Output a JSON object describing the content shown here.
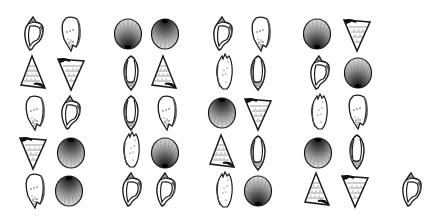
{
  "figure": {
    "title": "Shell matching array",
    "groups": 4,
    "rows": 5,
    "cols_per_group": 2
  },
  "colors": {
    "ink": "#1a1a1a",
    "shade": "#2b2b2b",
    "paper": "#ffffff"
  },
  "shell_types": {
    "conch": "whelk-shell-icon",
    "cone": "cone-shell-icon",
    "scallop_dark_top": "scallop-shell-dark-top-icon",
    "scallop_dark_bottom": "scallop-shell-dark-bottom-icon",
    "tri_up": "triangle-shell-up-icon",
    "tri_down": "triangle-shell-down-icon",
    "oliva": "olive-shell-icon",
    "torn": "broken-shell-icon"
  },
  "shells": [
    {
      "group": 1,
      "row": 1,
      "col": 1,
      "type": "conch",
      "x": 19,
      "y": 15
    },
    {
      "group": 1,
      "row": 1,
      "col": 2,
      "type": "cone",
      "x": 56,
      "y": 15
    },
    {
      "group": 1,
      "row": 2,
      "col": 1,
      "type": "tri_up",
      "x": 18,
      "y": 54
    },
    {
      "group": 1,
      "row": 2,
      "col": 2,
      "type": "tri_down",
      "x": 56,
      "y": 54
    },
    {
      "group": 1,
      "row": 3,
      "col": 1,
      "type": "cone",
      "x": 20,
      "y": 94
    },
    {
      "group": 1,
      "row": 3,
      "col": 2,
      "type": "conch",
      "x": 56,
      "y": 94
    },
    {
      "group": 1,
      "row": 4,
      "col": 1,
      "type": "tri_down",
      "x": 18,
      "y": 133
    },
    {
      "group": 1,
      "row": 4,
      "col": 2,
      "type": "scallop_dark_top",
      "x": 56,
      "y": 134
    },
    {
      "group": 1,
      "row": 5,
      "col": 1,
      "type": "cone",
      "x": 20,
      "y": 172
    },
    {
      "group": 1,
      "row": 5,
      "col": 2,
      "type": "scallop_dark_top",
      "x": 54,
      "y": 172
    },
    {
      "group": 2,
      "row": 1,
      "col": 1,
      "type": "scallop_dark_bottom",
      "x": 113,
      "y": 15
    },
    {
      "group": 2,
      "row": 1,
      "col": 2,
      "type": "scallop_dark_top",
      "x": 150,
      "y": 15
    },
    {
      "group": 2,
      "row": 2,
      "col": 1,
      "type": "oliva",
      "x": 116,
      "y": 54
    },
    {
      "group": 2,
      "row": 2,
      "col": 2,
      "type": "tri_up",
      "x": 149,
      "y": 54
    },
    {
      "group": 2,
      "row": 3,
      "col": 1,
      "type": "oliva",
      "x": 116,
      "y": 94
    },
    {
      "group": 2,
      "row": 3,
      "col": 2,
      "type": "cone",
      "x": 152,
      "y": 94
    },
    {
      "group": 2,
      "row": 4,
      "col": 1,
      "type": "torn",
      "x": 117,
      "y": 131
    },
    {
      "group": 2,
      "row": 4,
      "col": 2,
      "type": "scallop_dark_bottom",
      "x": 150,
      "y": 134
    },
    {
      "group": 2,
      "row": 5,
      "col": 1,
      "type": "conch",
      "x": 117,
      "y": 171
    },
    {
      "group": 2,
      "row": 5,
      "col": 2,
      "type": "conch",
      "x": 151,
      "y": 171
    },
    {
      "group": 3,
      "row": 1,
      "col": 1,
      "type": "conch",
      "x": 208,
      "y": 15
    },
    {
      "group": 3,
      "row": 1,
      "col": 2,
      "type": "cone",
      "x": 246,
      "y": 15
    },
    {
      "group": 3,
      "row": 2,
      "col": 1,
      "type": "torn",
      "x": 210,
      "y": 53
    },
    {
      "group": 3,
      "row": 2,
      "col": 2,
      "type": "oliva",
      "x": 243,
      "y": 54
    },
    {
      "group": 3,
      "row": 3,
      "col": 1,
      "type": "scallop_dark_top",
      "x": 207,
      "y": 94
    },
    {
      "group": 3,
      "row": 3,
      "col": 2,
      "type": "tri_down",
      "x": 243,
      "y": 94
    },
    {
      "group": 3,
      "row": 4,
      "col": 1,
      "type": "tri_up",
      "x": 207,
      "y": 133
    },
    {
      "group": 3,
      "row": 4,
      "col": 2,
      "type": "oliva",
      "x": 243,
      "y": 134
    },
    {
      "group": 3,
      "row": 5,
      "col": 1,
      "type": "torn",
      "x": 210,
      "y": 171
    },
    {
      "group": 3,
      "row": 5,
      "col": 2,
      "type": "scallop_dark_bottom",
      "x": 243,
      "y": 172
    },
    {
      "group": 4,
      "row": 1,
      "col": 1,
      "type": "scallop_dark_bottom",
      "x": 302,
      "y": 15
    },
    {
      "group": 4,
      "row": 1,
      "col": 2,
      "type": "tri_down",
      "x": 342,
      "y": 15
    },
    {
      "group": 4,
      "row": 2,
      "col": 1,
      "type": "conch",
      "x": 305,
      "y": 54
    },
    {
      "group": 4,
      "row": 2,
      "col": 2,
      "type": "scallop_dark_bottom",
      "x": 343,
      "y": 54
    },
    {
      "group": 4,
      "row": 3,
      "col": 1,
      "type": "torn",
      "x": 305,
      "y": 93
    },
    {
      "group": 4,
      "row": 3,
      "col": 2,
      "type": "cone",
      "x": 343,
      "y": 93
    },
    {
      "group": 4,
      "row": 4,
      "col": 1,
      "type": "scallop_dark_top",
      "x": 303,
      "y": 134
    },
    {
      "group": 4,
      "row": 4,
      "col": 2,
      "type": "oliva",
      "x": 342,
      "y": 133
    },
    {
      "group": 4,
      "row": 5,
      "col": 1,
      "type": "tri_up",
      "x": 302,
      "y": 171
    },
    {
      "group": 4,
      "row": 5,
      "col": 2,
      "type": "tri_down",
      "x": 340,
      "y": 171
    },
    {
      "group": 0,
      "row": 5,
      "col": 0,
      "type": "conch",
      "x": 397,
      "y": 171
    }
  ]
}
